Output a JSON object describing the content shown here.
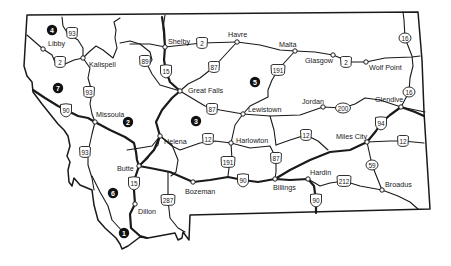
{
  "map": {
    "title": "Montana highway map",
    "colors": {
      "ink": "#1a1a1a",
      "background": "#ffffff",
      "region_marker": "#111111"
    },
    "cities": [
      {
        "id": "libby",
        "name": "Libby",
        "x": 43,
        "y": 49,
        "lx": 48,
        "ly": 46
      },
      {
        "id": "kalispell",
        "name": "Kalispell",
        "x": 83,
        "y": 58,
        "lx": 89,
        "ly": 67
      },
      {
        "id": "shelby",
        "name": "Shelby",
        "x": 165,
        "y": 47,
        "lx": 168,
        "ly": 44
      },
      {
        "id": "havre",
        "name": "Havre",
        "x": 237,
        "y": 42,
        "lx": 228,
        "ly": 37
      },
      {
        "id": "malta",
        "name": "Malta",
        "x": 295,
        "y": 51,
        "lx": 279,
        "ly": 47
      },
      {
        "id": "glasgow",
        "name": "Glasgow",
        "x": 333,
        "y": 55,
        "lx": 305,
        "ly": 63
      },
      {
        "id": "wolf-point",
        "name": "Wolf Point",
        "x": 366,
        "y": 62,
        "lx": 369,
        "ly": 70
      },
      {
        "id": "great-falls",
        "name": "Great Falls",
        "x": 180,
        "y": 91,
        "lx": 188,
        "ly": 93
      },
      {
        "id": "lewistown",
        "name": "Lewistown",
        "x": 243,
        "y": 114,
        "lx": 248,
        "ly": 112
      },
      {
        "id": "jordan",
        "name": "Jordan",
        "x": 323,
        "y": 107,
        "lx": 302,
        "ly": 104
      },
      {
        "id": "glendive",
        "name": "Glendive",
        "x": 401,
        "y": 107,
        "lx": 375,
        "ly": 102
      },
      {
        "id": "missoula",
        "name": "Missoula",
        "x": 95,
        "y": 122,
        "lx": 96,
        "ly": 117
      },
      {
        "id": "helena",
        "name": "Helena",
        "x": 160,
        "y": 136,
        "lx": 164,
        "ly": 144
      },
      {
        "id": "harlowton",
        "name": "Harlowton",
        "x": 231,
        "y": 143,
        "lx": 236,
        "ly": 143
      },
      {
        "id": "miles-city",
        "name": "Miles City",
        "x": 367,
        "y": 142,
        "lx": 336,
        "ly": 139
      },
      {
        "id": "butte",
        "name": "Butte",
        "x": 139,
        "y": 166,
        "lx": 117,
        "ly": 171
      },
      {
        "id": "bozeman",
        "name": "Bozeman",
        "x": 193,
        "y": 182,
        "lx": 185,
        "ly": 194
      },
      {
        "id": "billings",
        "name": "Billings",
        "x": 275,
        "y": 179,
        "lx": 273,
        "ly": 190
      },
      {
        "id": "hardin",
        "name": "Hardin",
        "x": 308,
        "y": 179,
        "lx": 310,
        "ly": 175
      },
      {
        "id": "broadus",
        "name": "Broadus",
        "x": 382,
        "y": 190,
        "lx": 385,
        "ly": 187
      },
      {
        "id": "dillon",
        "name": "Dillon",
        "x": 135,
        "y": 204,
        "lx": 138,
        "ly": 214
      }
    ],
    "shields": [
      {
        "route": "93",
        "type": "us",
        "x": 72,
        "y": 33
      },
      {
        "route": "2",
        "type": "us",
        "x": 60,
        "y": 62
      },
      {
        "route": "89",
        "type": "us",
        "x": 145,
        "y": 61
      },
      {
        "route": "15",
        "type": "interstate",
        "x": 166,
        "y": 71
      },
      {
        "route": "2",
        "type": "us",
        "x": 202,
        "y": 43
      },
      {
        "route": "87",
        "type": "us",
        "x": 214,
        "y": 67
      },
      {
        "route": "191",
        "type": "us",
        "x": 278,
        "y": 70
      },
      {
        "route": "2",
        "type": "us",
        "x": 346,
        "y": 62
      },
      {
        "route": "16",
        "type": "state",
        "x": 405,
        "y": 38
      },
      {
        "route": "93",
        "type": "us",
        "x": 89,
        "y": 92
      },
      {
        "route": "90",
        "type": "interstate",
        "x": 66,
        "y": 110
      },
      {
        "route": "87",
        "type": "us",
        "x": 212,
        "y": 109
      },
      {
        "route": "200",
        "type": "state",
        "x": 343,
        "y": 108
      },
      {
        "route": "16",
        "type": "state",
        "x": 409,
        "y": 92
      },
      {
        "route": "94",
        "type": "interstate",
        "x": 381,
        "y": 123
      },
      {
        "route": "12",
        "type": "us",
        "x": 208,
        "y": 139
      },
      {
        "route": "12",
        "type": "us",
        "x": 306,
        "y": 135
      },
      {
        "route": "12",
        "type": "us",
        "x": 403,
        "y": 141
      },
      {
        "route": "93",
        "type": "us",
        "x": 85,
        "y": 152
      },
      {
        "route": "191",
        "type": "us",
        "x": 228,
        "y": 162
      },
      {
        "route": "87",
        "type": "us",
        "x": 276,
        "y": 158
      },
      {
        "route": "15",
        "type": "interstate",
        "x": 134,
        "y": 183
      },
      {
        "route": "90",
        "type": "interstate",
        "x": 243,
        "y": 180
      },
      {
        "route": "59",
        "type": "state",
        "x": 372,
        "y": 165
      },
      {
        "route": "212",
        "type": "us",
        "x": 344,
        "y": 181
      },
      {
        "route": "90",
        "type": "interstate",
        "x": 316,
        "y": 200
      },
      {
        "route": "287",
        "type": "us",
        "x": 168,
        "y": 200
      }
    ],
    "regions": [
      {
        "label": "4",
        "x": 52,
        "y": 30
      },
      {
        "label": "7",
        "x": 58,
        "y": 88
      },
      {
        "label": "2",
        "x": 128,
        "y": 122
      },
      {
        "label": "3",
        "x": 196,
        "y": 121
      },
      {
        "label": "5",
        "x": 255,
        "y": 82
      },
      {
        "label": "6",
        "x": 113,
        "y": 193
      },
      {
        "label": "1",
        "x": 124,
        "y": 233
      }
    ]
  }
}
